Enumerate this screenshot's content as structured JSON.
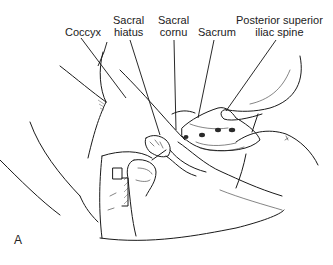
{
  "figure": {
    "panel_letter": "A",
    "labels": {
      "coccyx": "Coccyx",
      "sacral_hiatus_line1": "Sacral",
      "sacral_hiatus_line2": "hiatus",
      "sacral_cornu_line1": "Sacral",
      "sacral_cornu_line2": "cornu",
      "sacrum": "Sacrum",
      "psis_line1": "Posterior superior",
      "psis_line2": "iliac spine"
    },
    "colors": {
      "background": "#ffffff",
      "ink": "#1a1a1a"
    }
  }
}
